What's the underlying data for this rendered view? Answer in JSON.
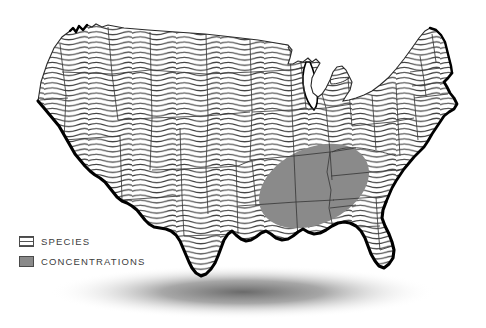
{
  "figure": {
    "background_color": "#ffffff",
    "width": 486,
    "height": 328
  },
  "map": {
    "region_name": "Contiguous United States",
    "fill_pattern": "horizontal-wavy-lines",
    "pattern_line_color": "#444444",
    "pattern_background_color": "#ffffff",
    "coastline_color": "#000000",
    "state_border_color": "#3a3a3a",
    "lake_fill_color": "#ffffff",
    "shadow_color": "#6b6b6b"
  },
  "overlay": {
    "name": "concentration-zone",
    "shape": "ellipse",
    "fill_color": "#8a8a8a",
    "region_description": "Mid-South / Tennessee Valley",
    "rotation_degrees": -25
  },
  "legend": {
    "items": [
      {
        "id": "species",
        "label": "SPECIES",
        "swatch_style": "hatched",
        "swatch_color": "#ffffff",
        "swatch_line_color": "#555555"
      },
      {
        "id": "concentrations",
        "label": "CONCENTRATIONS",
        "swatch_style": "solid",
        "swatch_color": "#8a8a8a",
        "swatch_line_color": "#4a4a4a"
      }
    ]
  }
}
